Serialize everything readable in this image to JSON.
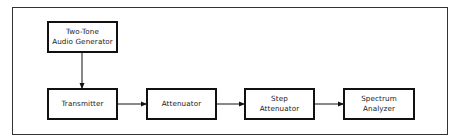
{
  "diagram": {
    "type": "block-diagram",
    "blocks": [
      {
        "id": "generator",
        "lines": [
          "Two-Tone",
          "Audio Generator"
        ]
      },
      {
        "id": "transmitter",
        "lines": [
          "Transmitter"
        ]
      },
      {
        "id": "attenuator",
        "lines": [
          "Attenuator"
        ]
      },
      {
        "id": "step_attenuator",
        "lines": [
          "Step",
          "Attenuator"
        ]
      },
      {
        "id": "spectrum_analyzer",
        "lines": [
          "Spectrum",
          "Analyzer"
        ]
      }
    ],
    "connections": [
      {
        "from": "generator",
        "to": "transmitter",
        "direction": "down"
      },
      {
        "from": "transmitter",
        "to": "attenuator",
        "direction": "right"
      },
      {
        "from": "attenuator",
        "to": "step_attenuator",
        "direction": "right"
      },
      {
        "from": "step_attenuator",
        "to": "spectrum_analyzer",
        "direction": "right"
      }
    ],
    "colors": {
      "stroke": "#111111",
      "background": "#ffffff",
      "text": "#222222"
    }
  }
}
